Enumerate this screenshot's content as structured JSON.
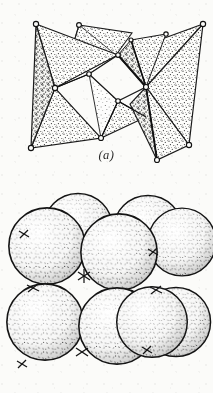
{
  "figure": {
    "kind": "line-drawing",
    "medium": "scanned halftone book illustration",
    "background_color": "#fbfbf9",
    "ink_color": "#1a1a1a",
    "stipple_color": "#3a3a3a",
    "panel_count": 2
  },
  "panels": [
    {
      "id": "a",
      "caption": "(a)",
      "subject": "polyhedral model of edge-sharing octahedra",
      "style": "outlined triangular faces filled with dense stipple; open circles mark shared vertices",
      "vertex_marker": "open-circle",
      "face_fill": "stipple",
      "void_description": "white rhombic opening at centre"
    },
    {
      "id": "b",
      "caption": "(b)",
      "subject": "space-filling close packing of spheres",
      "style": "outlined spheres with speckled shading, darker toward lower-right rims",
      "sphere_count": 10,
      "rows": 2,
      "per_row_front": 2,
      "per_row_back": 3
    }
  ],
  "captions": {
    "a": "(a)",
    "b": "(b)"
  },
  "colors": {
    "paper": "#fbfbf9",
    "ink": "#1a1a1a",
    "stipple": "#3a3a3a",
    "caption_text": "#2b2b2b"
  }
}
